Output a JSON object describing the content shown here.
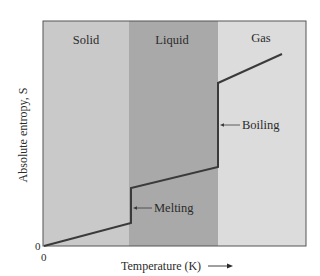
{
  "figure": {
    "type": "phase-entropy-diagram",
    "plot_area": {
      "left": 43,
      "top": 21,
      "right": 306,
      "bottom": 246
    }
  },
  "regions": [
    {
      "id": "solid",
      "label": "Solid",
      "x_start": 43,
      "x_end": 129,
      "color": "#c9c9c9"
    },
    {
      "id": "liquid",
      "label": "Liquid",
      "x_start": 129,
      "x_end": 218,
      "color": "#a9a9a9"
    },
    {
      "id": "gas",
      "label": "Gas",
      "x_start": 218,
      "x_end": 306,
      "color": "#dcdcdc"
    }
  ],
  "curve": {
    "color": "#3a3a3a",
    "points": [
      [
        44,
        246
      ],
      [
        131,
        223
      ],
      [
        131,
        188
      ],
      [
        218,
        167
      ],
      [
        218,
        83
      ],
      [
        282,
        54
      ]
    ]
  },
  "annotations": [
    {
      "id": "melting",
      "label": "Melting",
      "leader_from": [
        152,
        208
      ],
      "leader_to": [
        133,
        208
      ],
      "text_x": 154,
      "text_y": 212
    },
    {
      "id": "boiling",
      "label": "Boiling",
      "leader_from": [
        240,
        125
      ],
      "leader_to": [
        220,
        125
      ],
      "text_x": 242,
      "text_y": 129
    }
  ],
  "axes": {
    "x_label": "Temperature (K)",
    "x_arrow": "⟶",
    "y_label": "Absolute entropy, S",
    "x_origin_tick": "0",
    "y_origin_tick": "0"
  }
}
